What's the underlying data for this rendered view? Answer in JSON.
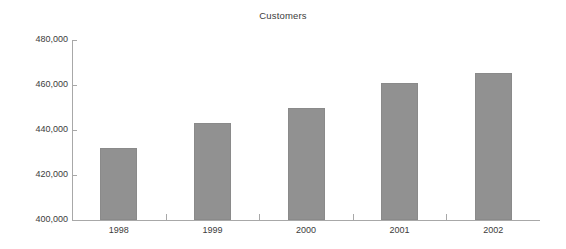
{
  "chart_data": {
    "type": "bar",
    "title": "Customers",
    "xlabel": "",
    "ylabel": "",
    "categories": [
      "1998",
      "1999",
      "2000",
      "2001",
      "2002"
    ],
    "values": [
      432000,
      443000,
      450000,
      461000,
      465500
    ],
    "ylim": [
      400000,
      480000
    ],
    "ytick_values": [
      480000,
      460000,
      440000,
      420000,
      400000
    ],
    "ytick_labels": [
      "480,000",
      "460,000",
      "440,000",
      "420,000",
      "400,000"
    ],
    "grid": false,
    "legend": null,
    "series": [
      {
        "name": "Customers",
        "values": [
          432000,
          443000,
          450000,
          461000,
          465500
        ]
      }
    ],
    "colors": {
      "bar_fill": "#919191",
      "bar_border": "#8a8a8a",
      "axis": "#a8a8a8",
      "text": "#3c3c3c",
      "background": "#ffffff"
    }
  }
}
